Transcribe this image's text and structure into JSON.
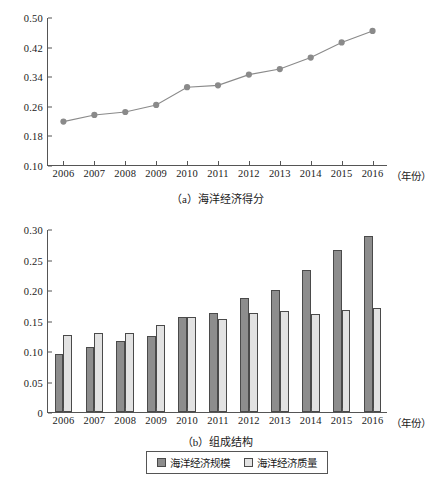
{
  "chart_data": [
    {
      "type": "line",
      "panel_label": "(a)",
      "title": "（a）海洋经济得分",
      "xlabel": "（年份）",
      "ylabel": "",
      "categories": [
        "2006",
        "2007",
        "2008",
        "2009",
        "2010",
        "2011",
        "2012",
        "2013",
        "2014",
        "2015",
        "2016"
      ],
      "series": [
        {
          "name": "海洋经济得分",
          "color": "#8a8a8a",
          "values": [
            0.22,
            0.238,
            0.246,
            0.265,
            0.313,
            0.318,
            0.347,
            0.362,
            0.393,
            0.434,
            0.465
          ]
        }
      ],
      "ylim": [
        0.1,
        0.5
      ],
      "yticks": [
        "0.10",
        "0.18",
        "0.26",
        "0.34",
        "0.42",
        "0.50"
      ],
      "ytick_values": [
        0.1,
        0.18,
        0.26,
        0.34,
        0.42,
        0.5
      ],
      "grid": false,
      "legend": "none",
      "marker": "circle"
    },
    {
      "type": "bar",
      "panel_label": "(b)",
      "title": "（b）组成结构",
      "xlabel": "（年份）",
      "ylabel": "",
      "categories": [
        "2006",
        "2007",
        "2008",
        "2009",
        "2010",
        "2011",
        "2012",
        "2013",
        "2014",
        "2015",
        "2016"
      ],
      "series": [
        {
          "name": "海洋经济规模",
          "color": "#8d8d8d",
          "values": [
            0.095,
            0.106,
            0.116,
            0.124,
            0.156,
            0.163,
            0.187,
            0.2,
            0.233,
            0.266,
            0.288
          ]
        },
        {
          "name": "海洋经济质量",
          "color": "#e2e2e2",
          "values": [
            0.127,
            0.13,
            0.13,
            0.142,
            0.156,
            0.152,
            0.162,
            0.166,
            0.161,
            0.168,
            0.17
          ]
        }
      ],
      "ylim": [
        0,
        0.3
      ],
      "yticks": [
        "0",
        "0.05",
        "0.10",
        "0.15",
        "0.20",
        "0.25",
        "0.30"
      ],
      "ytick_values": [
        0,
        0.05,
        0.1,
        0.15,
        0.2,
        0.25,
        0.3
      ],
      "grid": false,
      "legend": "bottom-center"
    }
  ],
  "legend": {
    "items": [
      {
        "label": "海洋经济规模",
        "color": "#8d8d8d"
      },
      {
        "label": "海洋经济质量",
        "color": "#e2e2e2"
      }
    ]
  }
}
